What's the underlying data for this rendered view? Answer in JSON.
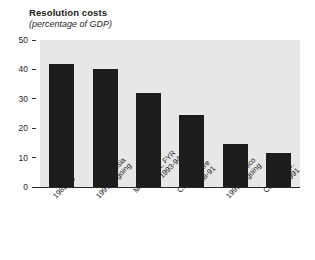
{
  "chart_data": {
    "type": "bar",
    "title": "Resolution costs",
    "subtitle": "(percentage of GDP)",
    "xlabel": "",
    "ylabel": "",
    "ylim": [
      0,
      50
    ],
    "yticks": [
      0,
      10,
      20,
      30,
      40,
      50
    ],
    "grid": false,
    "legend": null,
    "bar_color": "#1c1c1c",
    "plot_background": "#e7e7e7",
    "categories": [
      "Chile 1982-85",
      "Indonesia 1997-ongoing",
      "Macedonia, FYR 1993-94",
      "Côte d'Ivoire 1988-91",
      "Mexico 1995-ongoing",
      "Czech Rep. 1991"
    ],
    "category_names": [
      "Chile",
      "Indonesia",
      "Macedonia, FYR",
      "Côte d'Ivoire",
      "Mexico",
      "Czech Rep."
    ],
    "category_periods": [
      "1982-85",
      "1997-ongoing",
      "1993-94",
      "1988-91",
      "1995-ongoing",
      "1991"
    ],
    "values": [
      42,
      40,
      32,
      24.5,
      14.5,
      11.5
    ]
  },
  "axis": {
    "y_tick_labels": [
      "50",
      "40",
      "30",
      "20",
      "10",
      "0"
    ]
  }
}
